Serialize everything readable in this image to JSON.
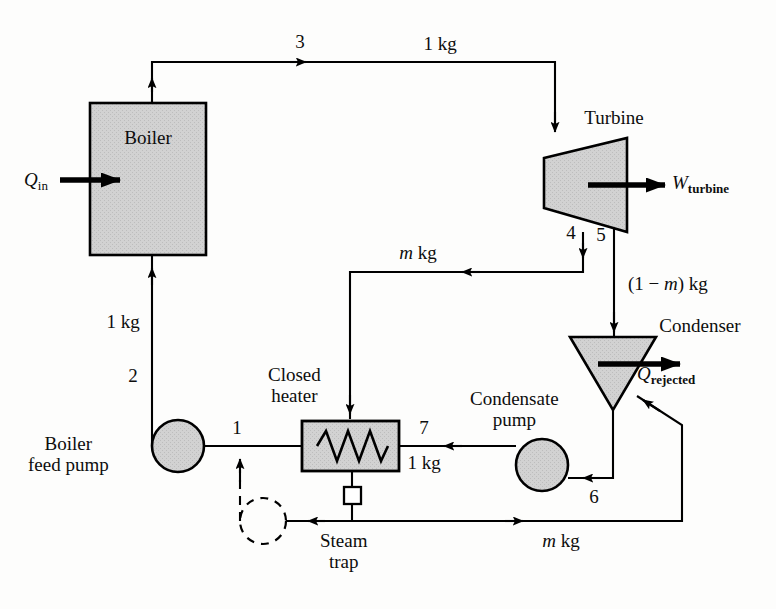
{
  "figure": {
    "type": "process-flow-diagram"
  },
  "components": {
    "boiler": {
      "label": "Boiler"
    },
    "turbine": {
      "label": "Turbine"
    },
    "condenser": {
      "label": "Condenser"
    },
    "closed_heater": {
      "label_line1": "Closed",
      "label_line2": "heater"
    },
    "boiler_feed_pump": {
      "label_line1": "Boiler",
      "label_line2": "feed pump"
    },
    "condensate_pump": {
      "label_line1": "Condensate",
      "label_line2": "pump"
    },
    "steam_trap": {
      "label_line1": "Steam",
      "label_line2": "trap"
    }
  },
  "energy_labels": {
    "heat_in_symbol": "Q",
    "heat_in_sub": "in",
    "work_symbol": "W",
    "work_sub": "turbine",
    "heat_out_symbol": "Q",
    "heat_out_sub": "rejected"
  },
  "state_points": [
    {
      "id": "1",
      "label": "1"
    },
    {
      "id": "2",
      "label": "2"
    },
    {
      "id": "3",
      "label": "3"
    },
    {
      "id": "4",
      "label": "4"
    },
    {
      "id": "5",
      "label": "5"
    },
    {
      "id": "6",
      "label": "6"
    },
    {
      "id": "7",
      "label": "7"
    }
  ],
  "mass_flow_labels": {
    "boiler_inlet": "1 kg",
    "boiler_outlet": "1 kg",
    "extraction": "m kg",
    "extraction_italic_symbol": "m",
    "extraction_unit": " kg",
    "turbine_exit": "(1 − m) kg",
    "turbine_exit_prefix": "(1 − ",
    "turbine_exit_symbol": "m",
    "turbine_exit_suffix": ") kg",
    "heater_outlet": "1 kg",
    "trap_return": "m kg"
  },
  "colors": {
    "fill_gray": "#cfcfcf",
    "stroke": "#000000",
    "background": "#fdfdfc",
    "text": "#0d0d0d"
  }
}
